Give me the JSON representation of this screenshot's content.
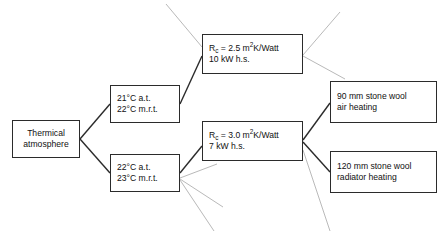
{
  "diagram": {
    "background_color": "#ffffff",
    "edge_color": "#2b2b2b",
    "ghost_edge_color": "#b9b9b9",
    "nodes": {
      "root": {
        "line1": "Thermical",
        "line2": "atmosphere"
      },
      "temp_upper": {
        "line1_value": "21",
        "line1_unit": "°C a.t.",
        "line2_value": "22",
        "line2_unit": "°C m.r.t."
      },
      "temp_lower": {
        "line1_value": "22",
        "line1_unit": "°C a.t.",
        "line2_value": "23",
        "line2_unit": "°C m.r.t."
      },
      "rc_upper": {
        "label_symbol": "R",
        "label_sub": "c",
        "equals_value": " = 2.5 m",
        "exponent": "2",
        "unit_tail": "K/Watt",
        "line2": "10 kW h.s."
      },
      "rc_lower": {
        "label_symbol": "R",
        "label_sub": "c",
        "equals_value": " = 3.0 m",
        "exponent": "2",
        "unit_tail": "K/Watt",
        "line2": "7 kW h.s."
      },
      "result_upper": {
        "line1": "90 mm stone wool",
        "line2": "air heating"
      },
      "result_lower": {
        "line1": "120 mm stone wool",
        "line2": "radiator heating"
      }
    }
  }
}
